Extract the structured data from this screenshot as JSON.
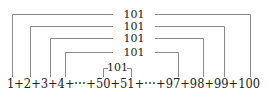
{
  "diagram": {
    "equation": "1+2+3+4+⋯+50+51+⋯+97+98+99+100",
    "pair_sum_label": "101",
    "pairs": [
      {
        "left": "1",
        "right": "100",
        "sum": "101"
      },
      {
        "left": "2",
        "right": "99",
        "sum": "101"
      },
      {
        "left": "3",
        "right": "98",
        "sum": "101"
      },
      {
        "left": "4",
        "right": "97",
        "sum": "101"
      },
      {
        "left": "50",
        "right": "51",
        "sum": "101"
      }
    ]
  }
}
